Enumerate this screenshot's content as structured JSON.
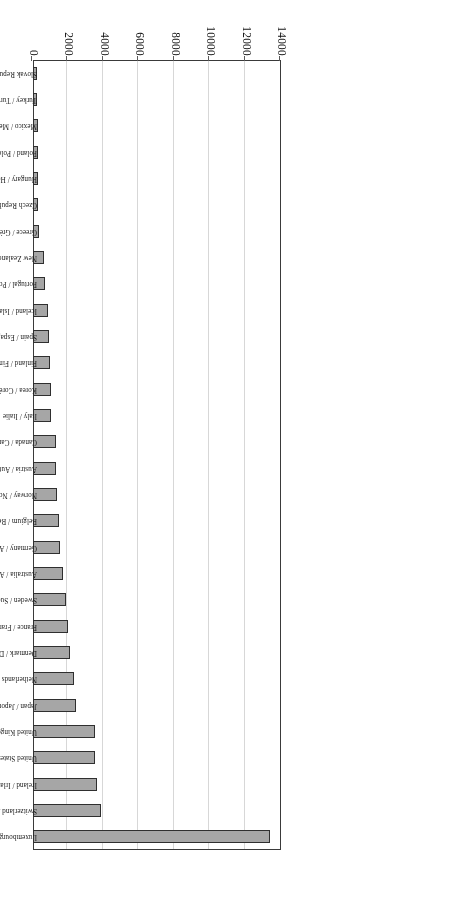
{
  "figure": {
    "orientation": "rotated-180",
    "type": "horizontal-bar-chart",
    "background_color": "#ffffff",
    "bar_fill_color": "#a6a6a6",
    "bar_border_color": "#2f2f2f",
    "grid_color": "#d7d7d7",
    "axis_color": "#3a3a3a"
  },
  "axis": {
    "ticks": [
      "0",
      "2000",
      "4000",
      "6000",
      "8000",
      "10000",
      "12000",
      "14000"
    ]
  },
  "chart_data": {
    "type": "bar",
    "title": "",
    "subtitle": "",
    "xlabel": "",
    "ylabel": "",
    "xlim": [
      0,
      14000
    ],
    "grid": true,
    "legend": null,
    "orientation": "horizontal",
    "categories": [
      "Luxembourg / Luxembourg",
      "Switzerland / Suisse",
      "Ireland / Irlande",
      "United States / États-Unis",
      "United Kingdom / Royaume-Uni",
      "Japan / Japon",
      "Netherlands / Pays-Bas",
      "Denmark / Danemark",
      "France / France",
      "Sweden / Suède",
      "Australia / Australie",
      "Germany / Allemagne",
      "Belgium / Belgique",
      "Norway / Norvège",
      "Austria / Autriche",
      "Canada / Canada",
      "Italy / Italie",
      "Korea / Corée",
      "Finland / Finlande",
      "Spain / Espagne",
      "Iceland / Islande",
      "Portugal / Portugal",
      "New Zealand / Nouvelle Zélande",
      "Greece / Grèce",
      "Czech Republic / République Tchèque",
      "Hungary / Hongrie",
      "Poland / Pologne",
      "Mexico / Mexique",
      "Turkey / Turquie",
      "Slovak Republic / République Slovaque"
    ],
    "values": [
      13400,
      3840,
      3600,
      3520,
      3480,
      2420,
      2320,
      2070,
      1960,
      1880,
      1700,
      1510,
      1490,
      1380,
      1320,
      1290,
      1030,
      1010,
      980,
      880,
      820,
      700,
      600,
      330,
      300,
      290,
      280,
      260,
      220,
      200
    ]
  }
}
